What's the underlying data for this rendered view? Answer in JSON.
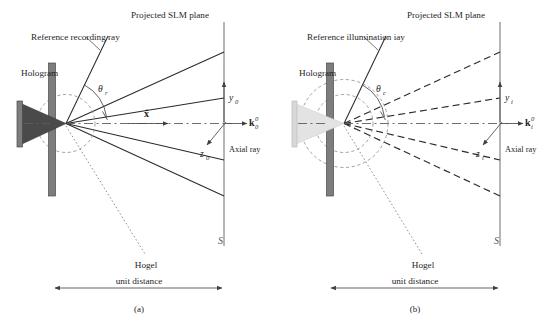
{
  "figure": {
    "caption_a": "(a)",
    "caption_b": "(b)"
  },
  "panel_a": {
    "title_slm": "Projected SLM plane",
    "label_reference_ray": "Reference recording ray",
    "label_hologram": "Hologram",
    "label_hogel": "Hogel",
    "label_unit_distance": "unit distance",
    "label_axial_ray": "Axial ray",
    "angle_symbol": "θ",
    "angle_subscript": "r",
    "axis_y": "y",
    "axis_y_sub": "0",
    "axis_z": "z",
    "axis_z_sub": "0",
    "wavevector": "k",
    "wavevector_sub": "0",
    "wavevector_sup": "0",
    "unit_vector": "x̂",
    "slm_plane_symbol": "S",
    "ray_style": "solid"
  },
  "panel_b": {
    "title_slm": "Projected SLM plane",
    "label_reference_ray": "Reference illumination iay",
    "label_hologram": "Hologram",
    "label_hogel": "Hogel",
    "label_unit_distance": "unit distance",
    "label_axial_ray": "Axial ray",
    "angle_symbol": "θ",
    "angle_subscript": "c",
    "axis_y": "y",
    "axis_y_sub": "i",
    "axis_z": "z",
    "axis_z_sub": "i",
    "wavevector": "k",
    "wavevector_sub": "i",
    "wavevector_sup": "0",
    "slm_plane_symbol": "S",
    "ray_style": "dashed"
  },
  "colors": {
    "ray": "#2b2b2b",
    "plane": "#6e6e6e",
    "hologram_plate_a": "#7d7d7d",
    "hologram_plate_b": "#7d7d7d",
    "cone_a": "#4a4a4a",
    "cone_b": "#e3e3e3",
    "background": "#ffffff"
  }
}
